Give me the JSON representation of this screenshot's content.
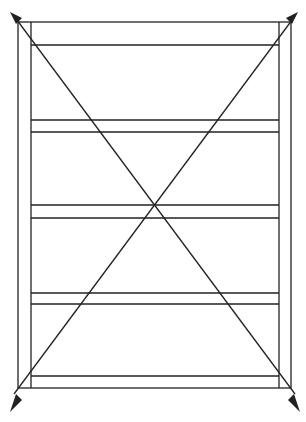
{
  "diagram": {
    "type": "line-drawing",
    "colors": {
      "stroke": "#222222",
      "background": "#ffffff"
    },
    "outer_frame": {
      "x1": 18,
      "y1": 22,
      "x2": 291,
      "y2": 388
    },
    "inner_rails": {
      "left_x": 31,
      "right_x": 279
    },
    "horizontal_lines_y": [
      45,
      120,
      132,
      205,
      218,
      293,
      304,
      366,
      376
    ],
    "diagonals": [
      {
        "from": [
          291,
          22
        ],
        "to": [
          18,
          388
        ],
        "arrowheads": [
          "top-right",
          "bottom-left"
        ]
      },
      {
        "from": [
          18,
          22
        ],
        "to": [
          291,
          388
        ],
        "arrowheads": [
          "top-left",
          "bottom-right"
        ]
      }
    ]
  }
}
